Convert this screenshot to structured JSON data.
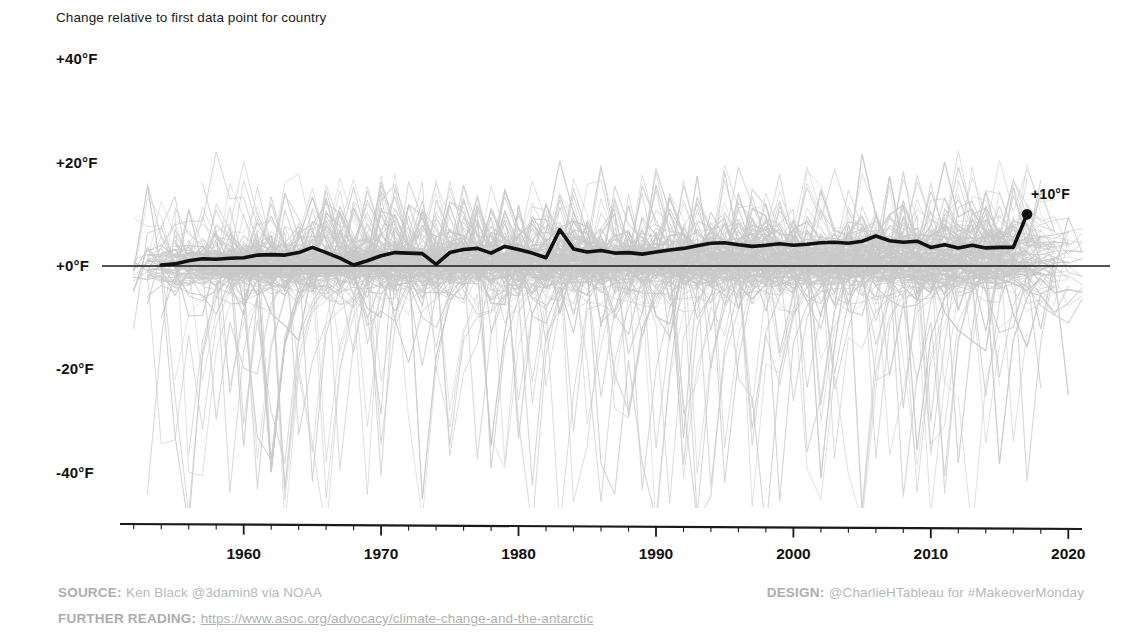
{
  "chart_data": {
    "type": "line",
    "title": "Change relative to first data point for country",
    "xlabel": "",
    "ylabel": "",
    "xlim": [
      1951,
      2021
    ],
    "ylim": [
      -50,
      44
    ],
    "grid": false,
    "legend_position": "none",
    "x_ticks": [
      1960,
      1970,
      1980,
      1990,
      2000,
      2010,
      2020
    ],
    "x_tick_labels": [
      "1960",
      "1970",
      "1980",
      "1990",
      "2000",
      "2010",
      "2020"
    ],
    "x_minor_tick_step": 2,
    "y_ticks": [
      40,
      20,
      0,
      -20,
      -40
    ],
    "y_tick_labels": [
      "+40°F",
      "+20°F",
      "+0°F",
      "-20°F",
      "-40°F"
    ],
    "zero_reference_line": 0,
    "annotations": [
      {
        "name": "endpoint-value",
        "text": "+10°F",
        "x": 2017,
        "y": 10
      }
    ],
    "colors": {
      "background_series": "#c9c9c9",
      "highlight_series": "#111111",
      "zero_line": "#1a1a1a",
      "axis": "#1a1a1a",
      "text": "#111111",
      "footer_text": "#b4b4b4"
    },
    "series": [
      {
        "name": "highlighted-country",
        "role": "highlight",
        "x": [
          1954,
          1955,
          1956,
          1957,
          1958,
          1959,
          1960,
          1961,
          1962,
          1963,
          1964,
          1965,
          1966,
          1967,
          1968,
          1969,
          1970,
          1971,
          1972,
          1973,
          1974,
          1975,
          1976,
          1977,
          1978,
          1979,
          1980,
          1981,
          1982,
          1983,
          1984,
          1985,
          1986,
          1987,
          1988,
          1989,
          1990,
          1991,
          1992,
          1993,
          1994,
          1995,
          1996,
          1997,
          1998,
          1999,
          2000,
          2001,
          2002,
          2003,
          2004,
          2005,
          2006,
          2007,
          2008,
          2009,
          2010,
          2011,
          2012,
          2013,
          2014,
          2015,
          2016,
          2017
        ],
        "values": [
          0.2,
          0.4,
          1.0,
          1.4,
          1.3,
          1.5,
          1.6,
          2.1,
          2.2,
          2.1,
          2.6,
          3.6,
          2.6,
          1.5,
          0.2,
          1.0,
          2.0,
          2.6,
          2.5,
          2.4,
          0.3,
          2.6,
          3.2,
          3.4,
          2.5,
          3.8,
          3.2,
          2.5,
          1.6,
          7.0,
          3.3,
          2.7,
          3.0,
          2.5,
          2.6,
          2.3,
          2.7,
          3.1,
          3.4,
          3.9,
          4.4,
          4.5,
          4.1,
          3.8,
          4.0,
          4.3,
          4.0,
          4.2,
          4.5,
          4.6,
          4.4,
          4.8,
          5.8,
          4.9,
          4.6,
          4.8,
          3.6,
          4.1,
          3.5,
          4.0,
          3.5,
          3.6,
          3.6,
          10.0
        ]
      },
      {
        "name": "other-countries",
        "role": "background",
        "count": 190,
        "note": "Light gray spaghetti lines for all other countries, roughly spanning -50°F to +28°F with a widening trend over time",
        "envelope_upper": 28,
        "envelope_lower": -50
      }
    ]
  },
  "footer": {
    "source_key": "SOURCE:",
    "source_value": "Ken Black @3damin8 via NOAA",
    "design_key": "DESIGN:",
    "design_value": "@CharlieHTableau for #MakeoverMonday",
    "reading_key": "FURTHER READING:",
    "reading_link": "https://www.asoc.org/advocacy/climate-change-and-the-antarctic"
  }
}
